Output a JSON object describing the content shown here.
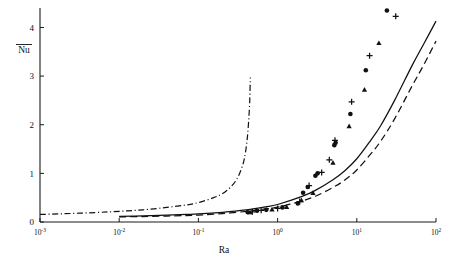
{
  "chart_data": {
    "type": "line",
    "title": "",
    "xlabel": "Ra",
    "ylabel": "Nu",
    "ylabel_has_overbar": true,
    "xscale": "log",
    "yscale": "linear",
    "xlim": [
      0.001,
      100
    ],
    "ylim": [
      0,
      4.4
    ],
    "grid": false,
    "legend": "none",
    "xtick_labels": [
      "10-3",
      "10-2",
      "10-1",
      "100",
      "101",
      "102"
    ],
    "xtick_mantissa": "10",
    "xtick_exponents": [
      "-3",
      "-2",
      "-1",
      "0",
      "1",
      "2"
    ],
    "xtick_values": [
      0.001,
      0.01,
      0.1,
      1,
      10,
      100
    ],
    "ytick_labels": [
      "0",
      "1",
      "2",
      "3",
      "4"
    ],
    "ytick_values": [
      0,
      1,
      2,
      3,
      4
    ],
    "series": [
      {
        "name": "solid-curve",
        "style": "solid",
        "x": [
          0.01,
          0.02,
          0.04,
          0.07,
          0.1,
          0.2,
          0.4,
          0.7,
          1.0,
          2.0,
          3.0,
          5.0,
          7.0,
          10.0,
          15.0,
          20.0,
          30.0,
          50.0,
          70.0,
          100.0
        ],
        "y": [
          0.115,
          0.125,
          0.14,
          0.155,
          0.165,
          0.2,
          0.25,
          0.31,
          0.36,
          0.52,
          0.65,
          0.87,
          1.05,
          1.3,
          1.68,
          1.98,
          2.5,
          3.22,
          3.66,
          4.13
        ]
      },
      {
        "name": "dashed-curve",
        "style": "dashed",
        "x": [
          0.01,
          0.02,
          0.04,
          0.07,
          0.1,
          0.2,
          0.4,
          0.7,
          1.0,
          2.0,
          3.0,
          5.0,
          7.0,
          10.0,
          15.0,
          20.0,
          30.0,
          50.0,
          70.0,
          100.0
        ],
        "y": [
          0.105,
          0.112,
          0.122,
          0.133,
          0.142,
          0.173,
          0.218,
          0.268,
          0.305,
          0.43,
          0.53,
          0.71,
          0.86,
          1.07,
          1.4,
          1.66,
          2.12,
          2.8,
          3.23,
          3.72
        ]
      },
      {
        "name": "dash-dot-curve",
        "style": "dashdot",
        "x": [
          0.001,
          0.002,
          0.005,
          0.01,
          0.02,
          0.04,
          0.07,
          0.1,
          0.15,
          0.2,
          0.26,
          0.31,
          0.35,
          0.38,
          0.41,
          0.43,
          0.445,
          0.452
        ],
        "y": [
          0.155,
          0.17,
          0.195,
          0.22,
          0.25,
          0.3,
          0.35,
          0.4,
          0.49,
          0.58,
          0.73,
          0.9,
          1.1,
          1.3,
          1.65,
          2.05,
          2.5,
          2.97
        ]
      }
    ],
    "scatter_series": [
      {
        "name": "circle-markers",
        "marker": "filled-circle",
        "points": [
          [
            0.42,
            0.2
          ],
          [
            0.55,
            0.23
          ],
          [
            0.72,
            0.25
          ],
          [
            1.15,
            0.3
          ],
          [
            1.8,
            0.38
          ],
          [
            2.1,
            0.6
          ],
          [
            2.4,
            0.72
          ],
          [
            3.0,
            0.95
          ],
          [
            3.2,
            1.0
          ],
          [
            5.2,
            1.58
          ],
          [
            5.4,
            1.63
          ],
          [
            8.3,
            2.22
          ],
          [
            13.0,
            3.12
          ],
          [
            24.0,
            4.35
          ]
        ]
      },
      {
        "name": "plus-markers",
        "marker": "plus",
        "points": [
          [
            0.48,
            0.21
          ],
          [
            0.62,
            0.24
          ],
          [
            1.0,
            0.28
          ],
          [
            1.9,
            0.42
          ],
          [
            2.5,
            0.75
          ],
          [
            3.6,
            1.02
          ],
          [
            4.5,
            1.28
          ],
          [
            5.3,
            1.68
          ],
          [
            8.6,
            2.47
          ],
          [
            14.5,
            3.42
          ],
          [
            31.0,
            4.23
          ]
        ]
      },
      {
        "name": "triangle-markers",
        "marker": "filled-triangle",
        "points": [
          [
            0.45,
            0.2
          ],
          [
            0.85,
            0.26
          ],
          [
            1.3,
            0.31
          ],
          [
            2.0,
            0.45
          ],
          [
            2.8,
            0.6
          ],
          [
            5.0,
            1.22
          ],
          [
            8.0,
            1.97
          ],
          [
            12.5,
            2.72
          ],
          [
            19.0,
            3.68
          ]
        ]
      }
    ]
  }
}
